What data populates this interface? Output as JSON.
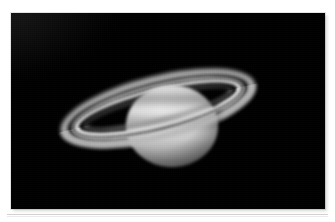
{
  "page": {
    "background_color": "#ffffff",
    "rule_color": "#d2d2d2"
  },
  "figure": {
    "name": "saturn-photograph",
    "alt_text": "Telescopic photograph of the planet Saturn with its ring system, grayscale, on a black sky background",
    "caption": "",
    "background_color": "#000000",
    "frame": {
      "left": 11,
      "top": 13,
      "width": 314,
      "height": 196
    }
  },
  "subject": {
    "object_name": "Saturn",
    "features": [
      "globe",
      "A ring",
      "Cassini division",
      "B ring",
      "C ring",
      "ring shadow on globe",
      "cloud belts"
    ],
    "ring_tilt_degrees": -14,
    "colors": {
      "sky": "#000000",
      "globe_bright": "#e6e6e6",
      "globe_mid": "#bcbcbc",
      "globe_dark": "#3a3a3a",
      "ring_a": "#b9b9b9",
      "ring_b": "#dcdcdc",
      "ring_c": "#6e6e6e",
      "cassini_division": "#1b1b1b"
    }
  }
}
